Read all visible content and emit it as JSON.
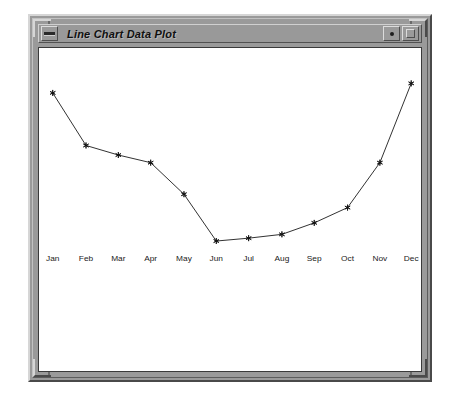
{
  "window": {
    "title": "Line Chart Data Plot",
    "menu_button_icon": "window-menu-dash-icon",
    "minimize_button_icon": "minimize-dot-icon",
    "maximize_button_icon": "maximize-square-icon"
  },
  "chart_data": {
    "type": "line",
    "title": "",
    "xlabel": "",
    "ylabel": "",
    "grid": false,
    "legend": false,
    "marker": "asterisk",
    "line_color": "#2b2b2b",
    "marker_color": "#111111",
    "categories": [
      "Jan",
      "Feb",
      "Mar",
      "Apr",
      "May",
      "Jun",
      "Jul",
      "Aug",
      "Sep",
      "Oct",
      "Nov",
      "Dec"
    ],
    "values": [
      82,
      49,
      43,
      38,
      18,
      -11,
      -9,
      -6,
      1,
      11,
      39,
      89
    ],
    "ylim": [
      -20,
      100
    ],
    "xlim": [
      0,
      11
    ],
    "series": [
      {
        "name": "Series 1",
        "values": [
          82,
          49,
          43,
          38,
          18,
          -11,
          -9,
          -6,
          1,
          11,
          39,
          89
        ]
      }
    ],
    "points_px": [
      {
        "label": "Jan",
        "x": 49,
        "y": 92
      },
      {
        "label": "Feb",
        "x": 83,
        "y": 147
      },
      {
        "label": "Mar",
        "x": 116,
        "y": 157
      },
      {
        "label": "Apr",
        "x": 149,
        "y": 165
      },
      {
        "label": "May",
        "x": 183,
        "y": 198
      },
      {
        "label": "Jun",
        "x": 216,
        "y": 247
      },
      {
        "label": "Jul",
        "x": 249,
        "y": 244
      },
      {
        "label": "Aug",
        "x": 283,
        "y": 240
      },
      {
        "label": "Sep",
        "x": 316,
        "y": 228
      },
      {
        "label": "Oct",
        "x": 350,
        "y": 212
      },
      {
        "label": "Nov",
        "x": 383,
        "y": 165
      },
      {
        "label": "Dec",
        "x": 415,
        "y": 82
      }
    ],
    "label_y_px": 268
  }
}
